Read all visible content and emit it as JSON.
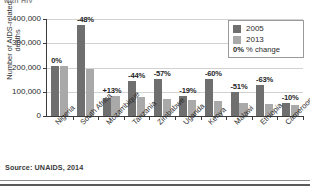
{
  "top_fragment": "with HIV",
  "source": "Source: UNAIDS, 2014",
  "legend": {
    "series": [
      {
        "label": "2005",
        "color": "#6f6f6f"
      },
      {
        "label": "2013",
        "color": "#a9a9a9"
      }
    ],
    "note_key": "0%",
    "note_text": "% change"
  },
  "colors": {
    "series_2005": "#6f6f6f",
    "series_2013": "#a9a9a9",
    "gridline": "#d2d2d2",
    "axis": "#3b3b3b"
  },
  "chart_data": {
    "type": "bar",
    "title": "",
    "xlabel": "",
    "ylabel": "Number of AIDS-related deaths",
    "ylim": [
      0,
      400000
    ],
    "yticks": [
      0,
      100000,
      200000,
      300000,
      400000
    ],
    "ytick_labels": [
      "0",
      "100,000",
      "200,000",
      "300,000",
      "400,000"
    ],
    "grid": true,
    "legend_position": "top-right",
    "categories": [
      "Nigeria",
      "South Africa",
      "Mozambique",
      "Tanzania",
      "Zimbabwe",
      "Uganda",
      "Kenya",
      "Malawi",
      "Ethiopia",
      "Cameroon"
    ],
    "series": [
      {
        "name": "2005",
        "values": [
          208000,
          375000,
          73000,
          143000,
          152000,
          83000,
          152000,
          100000,
          128000,
          52000
        ]
      },
      {
        "name": "2013",
        "values": [
          208000,
          195000,
          83000,
          80000,
          72000,
          67000,
          60000,
          54000,
          48000,
          47000
        ]
      }
    ],
    "annotations": [
      "0%",
      "-48%",
      "+13%",
      "-44%",
      "-57%",
      "-19%",
      "-60%",
      "-51%",
      "-63%",
      "-10%"
    ],
    "annotation_label": "% change"
  }
}
